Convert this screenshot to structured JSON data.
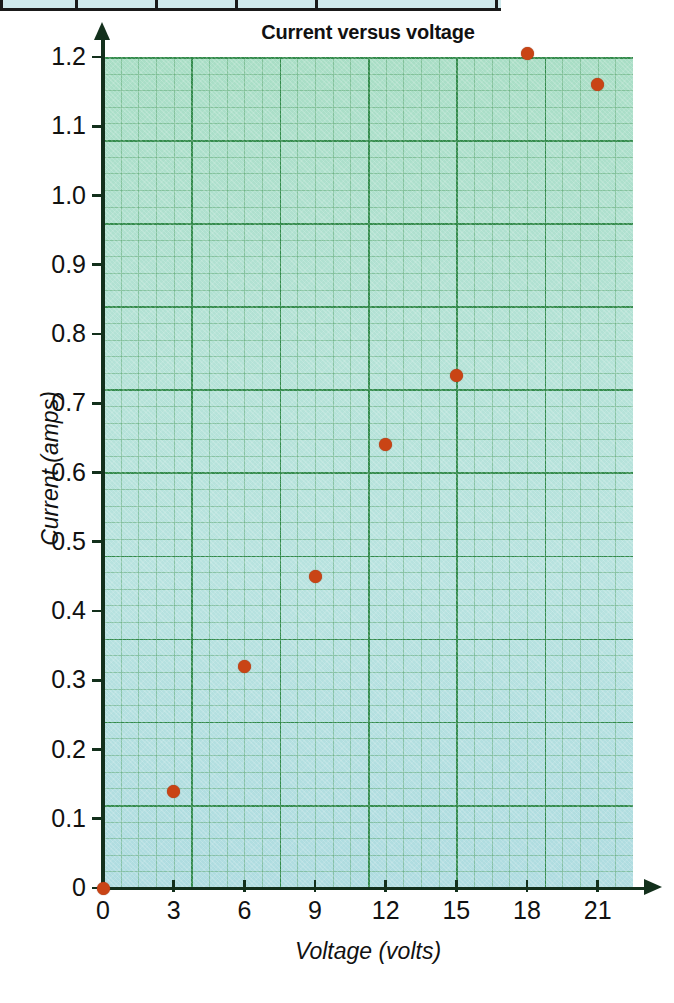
{
  "table_strip": {
    "name": "cropped-table-bottom-edge",
    "cell_widths": [
      78,
      80,
      80,
      80,
      180
    ]
  },
  "chart_data": {
    "type": "scatter",
    "title": "Current versus voltage",
    "xlabel": "Voltage (volts)",
    "ylabel": "Current (amps)",
    "xlim": [
      0,
      22.5
    ],
    "ylim": [
      0,
      1.2
    ],
    "xticks": [
      0,
      3,
      6,
      9,
      12,
      15,
      18,
      21
    ],
    "xtick_labels": [
      "0",
      "3",
      "6",
      "9",
      "12",
      "15",
      "18",
      "21"
    ],
    "yticks": [
      0,
      0.1,
      0.2,
      0.3,
      0.4,
      0.5,
      0.6,
      0.7,
      0.8,
      0.9,
      1.0,
      1.1,
      1.2
    ],
    "ytick_labels": [
      "0",
      "0.1",
      "0.2",
      "0.3",
      "0.4",
      "0.5",
      "0.6",
      "0.7",
      "0.8",
      "0.9",
      "1.0",
      "1.1",
      "1.2"
    ],
    "grid": true,
    "grid_minor": true,
    "legend": false,
    "series": [
      {
        "name": "measurements",
        "marker": "circle",
        "color": "#c94415",
        "x": [
          0,
          3,
          6,
          9,
          12,
          15,
          18,
          21
        ],
        "y": [
          0.0,
          0.14,
          0.32,
          0.45,
          0.64,
          0.74,
          1.205,
          1.16
        ]
      }
    ]
  },
  "colors": {
    "marker": "#c94415",
    "axis": "#13301c",
    "grid_major": "#2d8746",
    "grid_minor": "#5aa56e",
    "plot_background_top": "#96d7af",
    "plot_background_bottom": "#96cde1",
    "text": "#111111",
    "table_cell": "#cfe9ec",
    "table_border": "#1a1a1a"
  }
}
